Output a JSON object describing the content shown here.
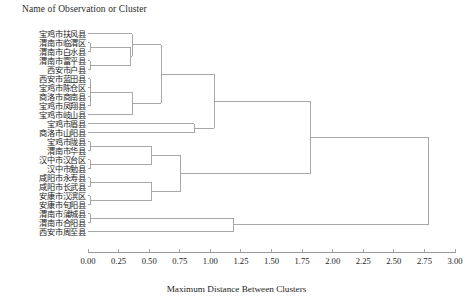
{
  "title": "Name of Observation or Cluster",
  "axis": {
    "label": "Maximum Distance Between Clusters",
    "ticks": [
      "0.00",
      "0.25",
      "0.50",
      "0.75",
      "1.00",
      "1.25",
      "1.50",
      "1.75",
      "2.00",
      "2.25",
      "2.50",
      "2.75",
      "3.00"
    ],
    "min": 0.0,
    "max": 3.0,
    "step": 0.25
  },
  "style": {
    "line_color": "#9a9a9a",
    "axis_color": "#8c8c8c",
    "background": "#ffffff"
  },
  "chart_data": {
    "type": "dendrogram",
    "title": "Name of Observation or Cluster",
    "xlabel": "Maximum Distance Between Clusters",
    "ylabel": "",
    "xlim": [
      0.0,
      3.0
    ],
    "grid": false,
    "legend": "none",
    "orientation": "horizontal-left-to-right",
    "leaves": [
      "宝鸡市扶风县",
      "渭南市临渭区",
      "渭南市白水县",
      "渭南市富平县",
      "西安市户县",
      "西安市蓝田县",
      "宝鸡市陈仓区",
      "商洛市商南县",
      "宝鸡市凤翔县",
      "宝鸡市岐山县",
      "宝鸡市眉县",
      "商洛市山阳县",
      "宝鸡市陇县",
      "渭南市华县",
      "汉中市汉台区",
      "汉中市勉县",
      "咸阳市永寿县",
      "咸阳市长武县",
      "安康市汉滨区",
      "安康市旬阳县",
      "渭南市蒲城县",
      "渭南市合阳县",
      "西安市周至县"
    ],
    "merges": [
      {
        "id": "m1",
        "left": {
          "leaf": 1
        },
        "right": {
          "leaf": 2
        },
        "distance": 0.02
      },
      {
        "id": "m2",
        "left": {
          "leaf": 3
        },
        "right": {
          "leaf": 4
        },
        "distance": 0.02
      },
      {
        "id": "m3",
        "left": {
          "node": "m1"
        },
        "right": {
          "node": "m2"
        },
        "distance": 0.35
      },
      {
        "id": "m4",
        "left": {
          "leaf": 0
        },
        "right": {
          "node": "m3"
        },
        "distance": 0.36
      },
      {
        "id": "m5",
        "left": {
          "leaf": 5
        },
        "right": {
          "leaf": 6
        },
        "distance": 0.02
      },
      {
        "id": "m6",
        "left": {
          "leaf": 7
        },
        "right": {
          "leaf": 8
        },
        "distance": 0.02
      },
      {
        "id": "m7",
        "left": {
          "node": "m5"
        },
        "right": {
          "node": "m6"
        },
        "distance": 0.02
      },
      {
        "id": "m8",
        "left": {
          "node": "m7"
        },
        "right": {
          "leaf": 9
        },
        "distance": 0.36
      },
      {
        "id": "m9",
        "left": {
          "node": "m4"
        },
        "right": {
          "node": "m8"
        },
        "distance": 0.6
      },
      {
        "id": "m10",
        "left": {
          "leaf": 10
        },
        "right": {
          "leaf": 11
        },
        "distance": 0.87
      },
      {
        "id": "m11",
        "left": {
          "node": "m9"
        },
        "right": {
          "node": "m10"
        },
        "distance": 1.03
      },
      {
        "id": "m12",
        "left": {
          "leaf": 12
        },
        "right": {
          "leaf": 13
        },
        "distance": 0.02
      },
      {
        "id": "m13",
        "left": {
          "leaf": 14
        },
        "right": {
          "leaf": 15
        },
        "distance": 0.02
      },
      {
        "id": "m14",
        "left": {
          "node": "m12"
        },
        "right": {
          "node": "m13"
        },
        "distance": 0.52
      },
      {
        "id": "m15",
        "left": {
          "leaf": 16
        },
        "right": {
          "leaf": 17
        },
        "distance": 0.02
      },
      {
        "id": "m16",
        "left": {
          "leaf": 18
        },
        "right": {
          "leaf": 19
        },
        "distance": 0.02
      },
      {
        "id": "m17",
        "left": {
          "node": "m15"
        },
        "right": {
          "node": "m16"
        },
        "distance": 0.52
      },
      {
        "id": "m18",
        "left": {
          "node": "m14"
        },
        "right": {
          "node": "m17"
        },
        "distance": 0.76
      },
      {
        "id": "m19",
        "left": {
          "node": "m11"
        },
        "right": {
          "node": "m18"
        },
        "distance": 1.82
      },
      {
        "id": "m20",
        "left": {
          "leaf": 20
        },
        "right": {
          "leaf": 21
        },
        "distance": 0.02
      },
      {
        "id": "m21",
        "left": {
          "node": "m20"
        },
        "right": {
          "leaf": 22
        },
        "distance": 1.19
      },
      {
        "id": "m22",
        "left": {
          "node": "m19"
        },
        "right": {
          "node": "m21"
        },
        "distance": 2.78
      }
    ],
    "root": "m22"
  }
}
